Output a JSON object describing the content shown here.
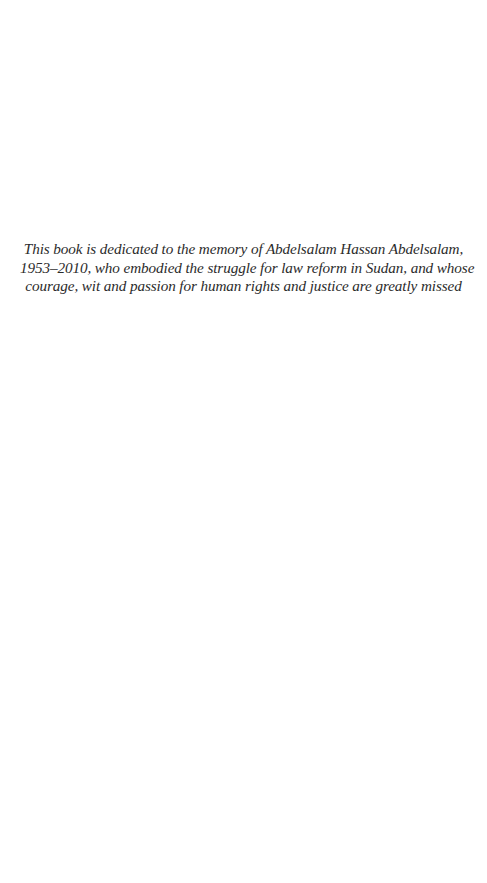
{
  "page": {
    "type": "dedication",
    "background": "#ffffff",
    "text_color": "#2b2b2b"
  },
  "dedication": {
    "lines": [
      "This book is dedicated to the memory of Abdelsalam Hassan Abdelsalam,",
      "1953–2010, who embodied the struggle for law reform in Sudan, and whose",
      "courage, wit and passion for human rights and justice are greatly missed"
    ]
  }
}
